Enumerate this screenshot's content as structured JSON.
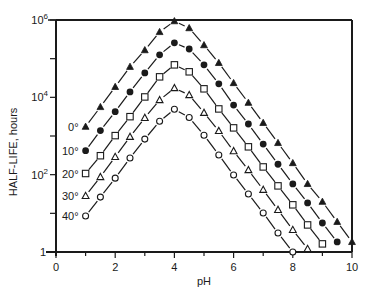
{
  "chart_data": {
    "type": "scatter",
    "title": "",
    "xlabel": "pH",
    "ylabel": "HALF-LIFE, hours",
    "xlim": [
      0,
      10
    ],
    "ylim": [
      1,
      1000000
    ],
    "yscale": "log",
    "grid": false,
    "legend": "inline labels at left of each series",
    "x_ticks": [
      0,
      2,
      4,
      6,
      8,
      10
    ],
    "x_tick_labels": [
      "0",
      "2",
      "4",
      "6",
      "8",
      "10"
    ],
    "y_ticks": [
      1,
      100,
      10000,
      1000000
    ],
    "y_tick_labels": [
      {
        "base": "1",
        "exp": ""
      },
      {
        "base": "10",
        "exp": "2"
      },
      {
        "base": "10",
        "exp": "4"
      },
      {
        "base": "10",
        "exp": "6"
      }
    ],
    "y_minor_ticks": [
      10,
      1000,
      100000
    ],
    "series": [
      {
        "name": "0°",
        "marker": "filled-triangle",
        "x": [
          1,
          1.5,
          2,
          2.5,
          3,
          3.5,
          4,
          4.5,
          5,
          5.5,
          6,
          6.5,
          7,
          7.5,
          8,
          8.5,
          9,
          9.5,
          10
        ],
        "log10_y": [
          3.24,
          3.75,
          4.27,
          4.79,
          5.22,
          5.69,
          5.97,
          5.79,
          5.35,
          4.89,
          4.37,
          3.86,
          3.34,
          2.82,
          2.3,
          1.76,
          1.3,
          0.78,
          0.26
        ]
      },
      {
        "name": "10°",
        "marker": "filled-circle",
        "x": [
          1,
          1.5,
          2,
          2.5,
          3,
          3.5,
          4,
          4.5,
          5,
          5.5,
          6,
          6.5,
          7,
          7.5,
          8,
          8.5,
          9,
          9.5
        ],
        "log10_y": [
          2.62,
          3.14,
          3.63,
          4.14,
          4.63,
          5.1,
          5.41,
          5.25,
          4.84,
          4.35,
          3.8,
          3.31,
          2.79,
          2.27,
          1.76,
          1.27,
          0.75,
          0.26
        ]
      },
      {
        "name": "20°",
        "marker": "open-square",
        "x": [
          1,
          1.5,
          2,
          2.5,
          3,
          3.5,
          4,
          4.5,
          5,
          5.5,
          6,
          6.5,
          7,
          7.5,
          8,
          8.5,
          9
        ],
        "log10_y": [
          2.03,
          2.49,
          3.01,
          3.5,
          4.01,
          4.53,
          4.84,
          4.66,
          4.22,
          3.7,
          3.21,
          2.72,
          2.2,
          1.71,
          1.22,
          0.7,
          0.21
        ]
      },
      {
        "name": "30°",
        "marker": "open-triangle",
        "x": [
          1,
          1.5,
          2,
          2.5,
          3,
          3.5,
          4,
          4.5,
          5,
          5.5,
          6,
          6.5,
          7,
          7.5,
          8,
          8.5
        ],
        "log10_y": [
          1.45,
          1.94,
          2.46,
          2.98,
          3.47,
          3.93,
          4.24,
          4.06,
          3.6,
          3.13,
          2.61,
          2.12,
          1.61,
          1.09,
          0.57,
          0.08
        ]
      },
      {
        "name": "40°",
        "marker": "open-circle",
        "x": [
          1,
          1.5,
          2,
          2.5,
          3,
          3.5,
          4,
          4.5,
          5,
          5.5,
          6,
          6.5,
          7,
          7.5,
          8
        ],
        "log10_y": [
          0.93,
          1.42,
          1.91,
          2.43,
          2.92,
          3.38,
          3.69,
          3.48,
          3.02,
          2.51,
          1.99,
          1.5,
          1.01,
          0.49,
          0.0
        ]
      }
    ],
    "colors": {
      "ink": "#1a1a1a",
      "background": "#ffffff"
    }
  }
}
